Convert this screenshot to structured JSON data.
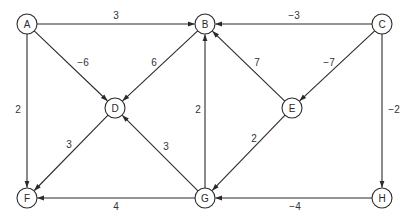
{
  "diagram": {
    "type": "directed-weighted-graph",
    "nodes": [
      {
        "id": "A",
        "label": "A",
        "x": 27,
        "y": 24
      },
      {
        "id": "B",
        "label": "B",
        "x": 205,
        "y": 24
      },
      {
        "id": "C",
        "label": "C",
        "x": 382,
        "y": 24
      },
      {
        "id": "D",
        "label": "D",
        "x": 115,
        "y": 108
      },
      {
        "id": "E",
        "label": "E",
        "x": 292,
        "y": 108
      },
      {
        "id": "F",
        "label": "F",
        "x": 27,
        "y": 198
      },
      {
        "id": "G",
        "label": "G",
        "x": 205,
        "y": 198
      },
      {
        "id": "H",
        "label": "H",
        "x": 382,
        "y": 198
      }
    ],
    "edges": [
      {
        "from": "A",
        "to": "B",
        "weight": "3",
        "lx": 116,
        "ly": 19
      },
      {
        "from": "A",
        "to": "D",
        "weight": "−6",
        "lx": 83,
        "ly": 66
      },
      {
        "from": "A",
        "to": "F",
        "weight": "2",
        "lx": 18,
        "ly": 113
      },
      {
        "from": "B",
        "to": "D",
        "weight": "6",
        "lx": 154,
        "ly": 66
      },
      {
        "from": "C",
        "to": "B",
        "weight": "−3",
        "lx": 294,
        "ly": 19
      },
      {
        "from": "C",
        "to": "E",
        "weight": "−7",
        "lx": 329,
        "ly": 66
      },
      {
        "from": "C",
        "to": "H",
        "weight": "−2",
        "lx": 394,
        "ly": 113
      },
      {
        "from": "E",
        "to": "B",
        "weight": "7",
        "lx": 257,
        "ly": 66
      },
      {
        "from": "D",
        "to": "F",
        "weight": "3",
        "lx": 69,
        "ly": 148
      },
      {
        "from": "G",
        "to": "D",
        "weight": "3",
        "lx": 166,
        "ly": 150
      },
      {
        "from": "G",
        "to": "B",
        "weight": "2",
        "lx": 198,
        "ly": 113
      },
      {
        "from": "E",
        "to": "G",
        "weight": "2",
        "lx": 254,
        "ly": 142
      },
      {
        "from": "G",
        "to": "F",
        "weight": "4",
        "lx": 116,
        "ly": 210
      },
      {
        "from": "H",
        "to": "G",
        "weight": "−4",
        "lx": 295,
        "ly": 210
      }
    ],
    "node_radius": 10,
    "stroke_color": "#2a2a2a"
  }
}
